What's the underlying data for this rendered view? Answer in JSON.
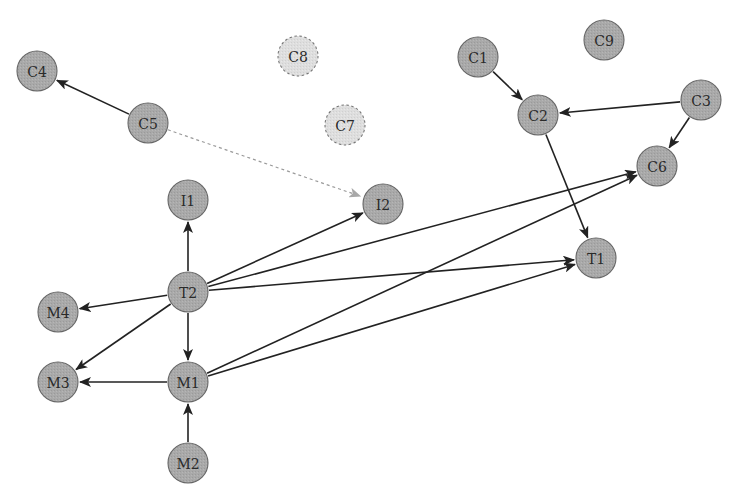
{
  "diagram": {
    "type": "directed-graph",
    "colors": {
      "node_fill": "#a9a9a9",
      "node_stroke": "#666666",
      "inactive_fill": "#dcdcdc",
      "inactive_stroke": "#777777",
      "edge": "#222222",
      "dashed_edge": "#9a9a9a"
    },
    "node_radius": 20,
    "nodes": [
      {
        "id": "C1",
        "label": "C1",
        "x": 478,
        "y": 57,
        "style": "solid"
      },
      {
        "id": "C2",
        "label": "C2",
        "x": 538,
        "y": 115,
        "style": "solid"
      },
      {
        "id": "C3",
        "label": "C3",
        "x": 701,
        "y": 100,
        "style": "solid"
      },
      {
        "id": "C4",
        "label": "C4",
        "x": 37,
        "y": 71,
        "style": "solid"
      },
      {
        "id": "C5",
        "label": "C5",
        "x": 148,
        "y": 123,
        "style": "solid"
      },
      {
        "id": "C6",
        "label": "C6",
        "x": 657,
        "y": 166,
        "style": "solid"
      },
      {
        "id": "C7",
        "label": "C7",
        "x": 345,
        "y": 125,
        "style": "dashed"
      },
      {
        "id": "C8",
        "label": "C8",
        "x": 298,
        "y": 56,
        "style": "dashed"
      },
      {
        "id": "C9",
        "label": "C9",
        "x": 604,
        "y": 40,
        "style": "solid"
      },
      {
        "id": "I1",
        "label": "I1",
        "x": 188,
        "y": 200,
        "style": "solid"
      },
      {
        "id": "I2",
        "label": "I2",
        "x": 383,
        "y": 204,
        "style": "solid"
      },
      {
        "id": "T1",
        "label": "T1",
        "x": 596,
        "y": 258,
        "style": "solid"
      },
      {
        "id": "T2",
        "label": "T2",
        "x": 188,
        "y": 292,
        "style": "solid"
      },
      {
        "id": "M1",
        "label": "M1",
        "x": 188,
        "y": 382,
        "style": "solid"
      },
      {
        "id": "M2",
        "label": "M2",
        "x": 188,
        "y": 463,
        "style": "solid"
      },
      {
        "id": "M3",
        "label": "M3",
        "x": 58,
        "y": 382,
        "style": "solid"
      },
      {
        "id": "M4",
        "label": "M4",
        "x": 58,
        "y": 312,
        "style": "solid"
      }
    ],
    "edges": [
      {
        "from": "C5",
        "to": "C4",
        "style": "solid"
      },
      {
        "from": "C5",
        "to": "I2",
        "style": "dashed"
      },
      {
        "from": "C1",
        "to": "C2",
        "style": "solid"
      },
      {
        "from": "C3",
        "to": "C2",
        "style": "solid"
      },
      {
        "from": "C3",
        "to": "C6",
        "style": "solid"
      },
      {
        "from": "C2",
        "to": "T1",
        "style": "solid"
      },
      {
        "from": "T2",
        "to": "I1",
        "style": "solid"
      },
      {
        "from": "T2",
        "to": "I2",
        "style": "solid"
      },
      {
        "from": "T2",
        "to": "C6",
        "style": "solid"
      },
      {
        "from": "T2",
        "to": "T1",
        "style": "solid"
      },
      {
        "from": "T2",
        "to": "M4",
        "style": "solid"
      },
      {
        "from": "T2",
        "to": "M3",
        "style": "solid"
      },
      {
        "from": "T2",
        "to": "M1",
        "style": "solid"
      },
      {
        "from": "M1",
        "to": "M3",
        "style": "solid"
      },
      {
        "from": "M2",
        "to": "M1",
        "style": "solid"
      },
      {
        "from": "M1",
        "to": "C6",
        "style": "solid"
      },
      {
        "from": "M1",
        "to": "T1",
        "style": "solid"
      }
    ]
  }
}
